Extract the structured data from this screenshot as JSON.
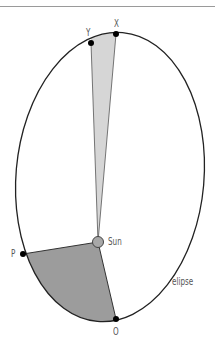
{
  "diagram": {
    "type": "orbital-ellipse-kepler-second-law",
    "labels": {
      "x": "X",
      "y": "Y",
      "sun": "Sun",
      "p": "P",
      "o": "O",
      "ellipse": "elipse"
    },
    "points": {
      "X": [
        116,
        34
      ],
      "Y": [
        91,
        43
      ],
      "P": [
        23,
        254
      ],
      "O": [
        116,
        319
      ],
      "Sun": [
        98,
        242
      ]
    },
    "colors": {
      "outline": "#222222",
      "light_sector": "#d6d6d6",
      "dark_sector": "#9c9c9c",
      "sun_fill": "#a8a8a8",
      "point": "#000000",
      "label": "#555555",
      "top_rule": "#9a9a9a"
    }
  }
}
